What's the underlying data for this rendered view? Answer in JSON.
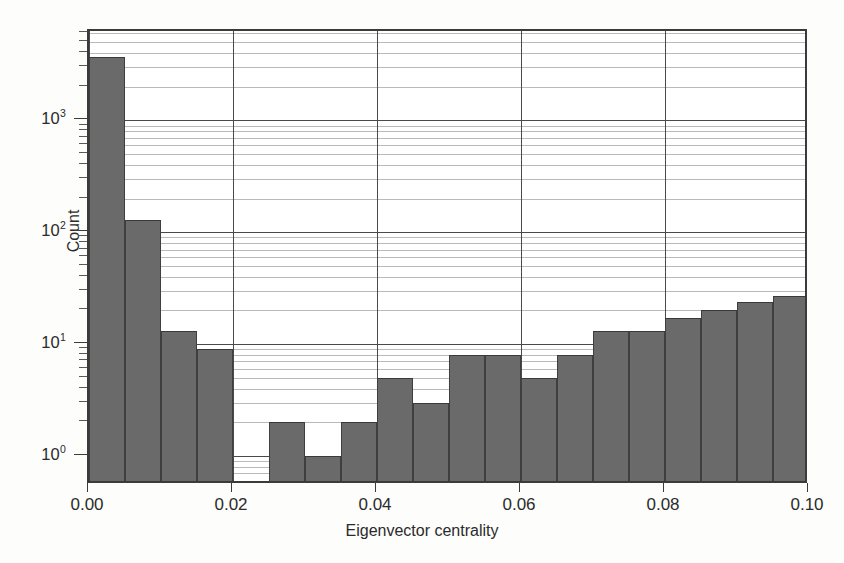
{
  "chart_data": {
    "type": "bar",
    "title": "",
    "subtitle": "",
    "xlabel": "Eigenvector centrality",
    "ylabel": "Count",
    "yscale": "log",
    "xscale": "linear",
    "xlim": [
      0.0,
      0.1
    ],
    "ylim": [
      0.55,
      6300
    ],
    "grid": true,
    "legend": null,
    "bin_width": 0.005,
    "xticks": [
      "0.00",
      "0.02",
      "0.04",
      "0.06",
      "0.08",
      "0.10"
    ],
    "xtick_values": [
      0.0,
      0.02,
      0.04,
      0.06,
      0.08,
      0.1
    ],
    "yticks": [
      "10",
      "10",
      "10",
      "10"
    ],
    "ytick_exponents": [
      "0",
      "1",
      "2",
      "3"
    ],
    "ytick_values": [
      1,
      10,
      100,
      1000
    ],
    "bar_color": "#6a6a6a",
    "bar_edge_color": "#3f3f3f",
    "axis_color": "#3b3b3b",
    "grid_color": "#b9b9b9",
    "bins": [
      {
        "x0": 0.0,
        "x1": 0.005,
        "count": 3700
      },
      {
        "x0": 0.005,
        "x1": 0.01,
        "count": 130
      },
      {
        "x0": 0.01,
        "x1": 0.015,
        "count": 13
      },
      {
        "x0": 0.015,
        "x1": 0.02,
        "count": 9
      },
      {
        "x0": 0.02,
        "x1": 0.025,
        "count": 0
      },
      {
        "x0": 0.025,
        "x1": 0.03,
        "count": 2
      },
      {
        "x0": 0.03,
        "x1": 0.035,
        "count": 1
      },
      {
        "x0": 0.035,
        "x1": 0.04,
        "count": 2
      },
      {
        "x0": 0.04,
        "x1": 0.045,
        "count": 5
      },
      {
        "x0": 0.045,
        "x1": 0.05,
        "count": 3
      },
      {
        "x0": 0.05,
        "x1": 0.055,
        "count": 8
      },
      {
        "x0": 0.055,
        "x1": 0.06,
        "count": 8
      },
      {
        "x0": 0.06,
        "x1": 0.065,
        "count": 5
      },
      {
        "x0": 0.065,
        "x1": 0.07,
        "count": 8
      },
      {
        "x0": 0.07,
        "x1": 0.075,
        "count": 13
      },
      {
        "x0": 0.075,
        "x1": 0.08,
        "count": 13
      },
      {
        "x0": 0.08,
        "x1": 0.085,
        "count": 17
      },
      {
        "x0": 0.085,
        "x1": 0.09,
        "count": 20
      },
      {
        "x0": 0.09,
        "x1": 0.095,
        "count": 24
      },
      {
        "x0": 0.095,
        "x1": 0.1,
        "count": 27
      }
    ],
    "bars_px": [
      {
        "left": 118,
        "width": 36,
        "top": 50,
        "count": 3700
      },
      {
        "left": 154,
        "width": 36,
        "top": 221,
        "count": 130
      },
      {
        "left": 190,
        "width": 36,
        "top": 332,
        "count": 13
      },
      {
        "left": 226,
        "width": 36,
        "top": 345,
        "count": 9
      },
      {
        "left": 298,
        "width": 36,
        "top": 435,
        "count": 2
      },
      {
        "left": 334,
        "width": 36,
        "top": 470,
        "count": 1
      },
      {
        "left": 370,
        "width": 36,
        "top": 435,
        "count": 2
      },
      {
        "left": 406,
        "width": 36,
        "top": 385,
        "count": 5
      },
      {
        "left": 442,
        "width": 36,
        "top": 415,
        "count": 3
      },
      {
        "left": 478,
        "width": 36,
        "top": 366,
        "count": 8
      },
      {
        "left": 514,
        "width": 36,
        "top": 366,
        "count": 8
      },
      {
        "left": 550,
        "width": 36,
        "top": 385,
        "count": 5
      },
      {
        "left": 586,
        "width": 36,
        "top": 366,
        "count": 8
      },
      {
        "left": 622,
        "width": 36,
        "top": 332,
        "count": 13
      },
      {
        "left": 658,
        "width": 36,
        "top": 332,
        "count": 13
      },
      {
        "left": 694,
        "width": 36,
        "top": 319,
        "count": 17
      },
      {
        "left": 730,
        "width": 36,
        "top": 310,
        "count": 20
      },
      {
        "left": 766,
        "width": 36,
        "top": 303,
        "count": 24
      },
      {
        "left": 802,
        "width": 36,
        "top": 297,
        "count": 27
      }
    ]
  }
}
